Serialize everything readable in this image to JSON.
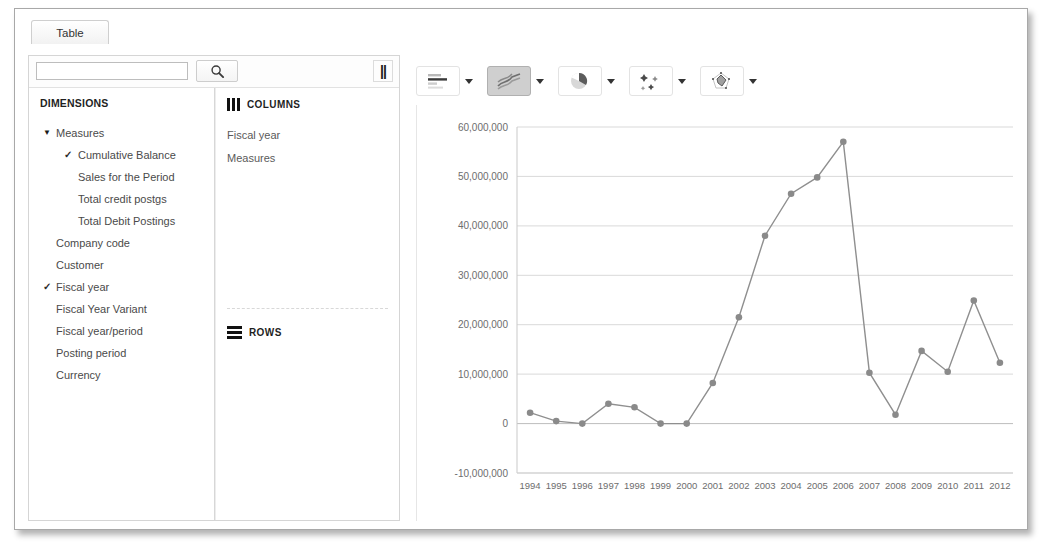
{
  "window": {
    "tabs": [
      {
        "label": "Table",
        "name": "tab-table"
      }
    ]
  },
  "search": {
    "value": "",
    "placeholder": "",
    "search_icon": "search-icon",
    "pause_icon": "pause-icon",
    "pause_glyph": "||"
  },
  "dimensions_panel": {
    "title": "DIMENSIONS",
    "items": [
      {
        "label": "Measures",
        "level": 0,
        "expanded": true,
        "checked": false,
        "caret": "▼"
      },
      {
        "label": "Cumulative Balance",
        "level": 1,
        "expanded": false,
        "checked": true,
        "caret": ""
      },
      {
        "label": "Sales for the Period",
        "level": 1,
        "expanded": false,
        "checked": false,
        "caret": ""
      },
      {
        "label": "Total credit postgs",
        "level": 1,
        "expanded": false,
        "checked": false,
        "caret": ""
      },
      {
        "label": "Total Debit Postings",
        "level": 1,
        "expanded": false,
        "checked": false,
        "caret": ""
      },
      {
        "label": "Company code",
        "level": 0,
        "expanded": false,
        "checked": false,
        "caret": ""
      },
      {
        "label": "Customer",
        "level": 0,
        "expanded": false,
        "checked": false,
        "caret": ""
      },
      {
        "label": "Fiscal year",
        "level": 0,
        "expanded": false,
        "checked": true,
        "caret": ""
      },
      {
        "label": "Fiscal Year Variant",
        "level": 0,
        "expanded": false,
        "checked": false,
        "caret": ""
      },
      {
        "label": "Fiscal year/period",
        "level": 0,
        "expanded": false,
        "checked": false,
        "caret": ""
      },
      {
        "label": "Posting period",
        "level": 0,
        "expanded": false,
        "checked": false,
        "caret": ""
      },
      {
        "label": "Currency",
        "level": 0,
        "expanded": false,
        "checked": false,
        "caret": ""
      }
    ],
    "check_glyph": "✓"
  },
  "columns_panel": {
    "title": "COLUMNS",
    "icon": "columns-icon",
    "fields": [
      "Fiscal year",
      "Measures"
    ]
  },
  "rows_panel": {
    "title": "ROWS",
    "icon": "rows-icon",
    "fields": []
  },
  "chart_toolbar": {
    "buttons": [
      {
        "name": "chart-type-bar",
        "icon": "bar-chart-icon",
        "selected": false,
        "caret": "chevron-down-icon"
      },
      {
        "name": "chart-type-line",
        "icon": "line-chart-icon",
        "selected": true,
        "caret": "chevron-down-icon"
      },
      {
        "name": "chart-type-pie",
        "icon": "pie-chart-icon",
        "selected": false,
        "caret": "chevron-down-icon"
      },
      {
        "name": "chart-type-scatter",
        "icon": "scatter-chart-icon",
        "selected": false,
        "caret": "chevron-down-icon"
      },
      {
        "name": "chart-type-radar",
        "icon": "radar-chart-icon",
        "selected": false,
        "caret": "chevron-down-icon"
      }
    ]
  },
  "chart_data": {
    "type": "line",
    "title": "",
    "xlabel": "",
    "ylabel": "",
    "grid": true,
    "legend": false,
    "line_color": "#8f8f8f",
    "marker_color": "#8a8a8a",
    "categories": [
      "1994",
      "1995",
      "1996",
      "1997",
      "1998",
      "1999",
      "2000",
      "2001",
      "2002",
      "2003",
      "2004",
      "2005",
      "2006",
      "2007",
      "2008",
      "2009",
      "2010",
      "2011",
      "2012"
    ],
    "series": [
      {
        "name": "Cumulative Balance",
        "values": [
          2200000,
          500000,
          0,
          4000000,
          3300000,
          0,
          0,
          8200000,
          21500000,
          38000000,
          46500000,
          49800000,
          57000000,
          10300000,
          1800000,
          14700000,
          10500000,
          24900000,
          12300000
        ]
      }
    ],
    "ylim": [
      -10000000,
      60000000
    ],
    "ytick_values": [
      60000000,
      50000000,
      40000000,
      30000000,
      20000000,
      10000000,
      0,
      -10000000
    ],
    "ytick_labels": [
      "60,000,000",
      "50,000,000",
      "40,000,000",
      "30,000,000",
      "20,000,000",
      "10,000,000",
      "0",
      "-10,000,000"
    ]
  }
}
